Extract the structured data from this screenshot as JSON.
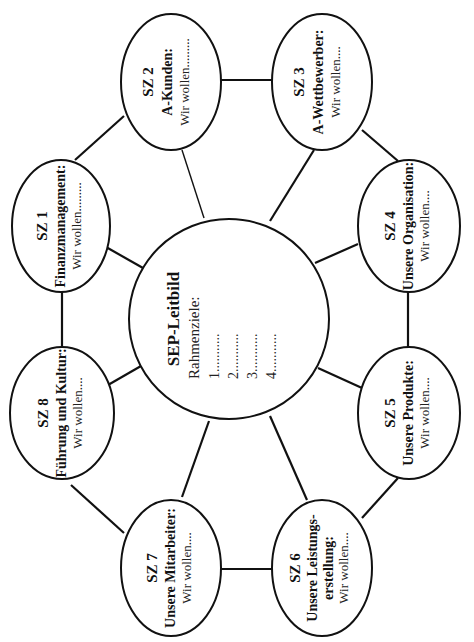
{
  "center": {
    "title": "SEP-Leitbild",
    "subtitle": "Rahmenziele:",
    "items": [
      "1...........",
      "2...........",
      "3...........",
      "4..........."
    ]
  },
  "nodes": [
    {
      "id": "SZ 1",
      "title": "Finanzmanagement:",
      "title2": "",
      "body": "Wir wollen........."
    },
    {
      "id": "SZ 2",
      "title": "A-Kunden:",
      "title2": "",
      "body": "Wir wollen........."
    },
    {
      "id": "SZ 3",
      "title": "A-Wettbewerber:",
      "title2": "",
      "body": "Wir wollen...."
    },
    {
      "id": "SZ 4",
      "title": "Unsere Organisation:",
      "title2": "",
      "body": "Wir wollen...."
    },
    {
      "id": "SZ 5",
      "title": "Unsere Produkte:",
      "title2": "",
      "body": "Wir wollen...."
    },
    {
      "id": "SZ 6",
      "title": "Unsere Leistungs-",
      "title2": "erstellung:",
      "body": "Wir wollen...."
    },
    {
      "id": "SZ 7",
      "title": "Unsere Mitarbeiter:",
      "title2": "",
      "body": "Wir wollen...."
    },
    {
      "id": "SZ 8",
      "title": "Führung und Kultur:",
      "title2": "",
      "body": "Wir wollen...."
    }
  ],
  "layout": {
    "orientation": "rotated -90deg (text reads bottom-to-top)",
    "line_color": "#111111",
    "background": "#ffffff"
  }
}
